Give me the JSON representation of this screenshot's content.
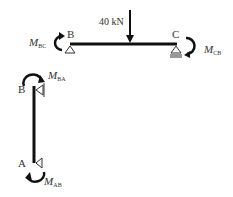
{
  "diagram": {
    "type": "structural-free-body",
    "colors": {
      "member": "#111111",
      "text": "#333333",
      "support": "#333333",
      "background": "#ffffff"
    },
    "beam": {
      "name": "BC",
      "points": {
        "B": "B",
        "C": "C"
      },
      "load": {
        "value_label": "40 kN",
        "direction": "down"
      },
      "moments": {
        "left": {
          "symbol": "M",
          "sub": "BC"
        },
        "right": {
          "symbol": "M",
          "sub": "CB"
        }
      },
      "supports": {
        "B": "pin",
        "C": "roller"
      }
    },
    "column": {
      "name": "AB",
      "points": {
        "top": "B",
        "bottom": "A"
      },
      "moments": {
        "top": {
          "symbol": "M",
          "sub": "BA"
        },
        "bottom": {
          "symbol": "M",
          "sub": "AB"
        }
      },
      "supports": {
        "top": "pin-side",
        "bottom": "pin-side"
      }
    }
  }
}
